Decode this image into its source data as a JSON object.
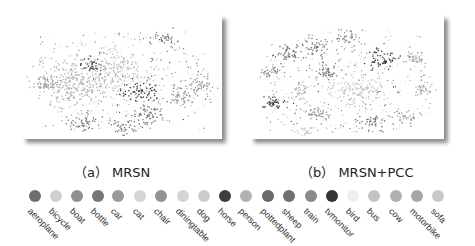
{
  "figure": {
    "panels": [
      {
        "id": "a",
        "caption": "（a） MRSN"
      },
      {
        "id": "b",
        "caption": "（b） MRSN+PCC"
      }
    ]
  },
  "legend": {
    "items": [
      {
        "label": "aeroplane",
        "color": "#6e6e6e"
      },
      {
        "label": "bicycle",
        "color": "#cfcfcf"
      },
      {
        "label": "boat",
        "color": "#8f8f8f"
      },
      {
        "label": "bottle",
        "color": "#777777"
      },
      {
        "label": "car",
        "color": "#9a9a9a"
      },
      {
        "label": "cat",
        "color": "#d6d6d6"
      },
      {
        "label": "chair",
        "color": "#929292"
      },
      {
        "label": "diningtable",
        "color": "#d4d4d4"
      },
      {
        "label": "dog",
        "color": "#cccccc"
      },
      {
        "label": "horse",
        "color": "#3e3e3e"
      },
      {
        "label": "person",
        "color": "#b2b2b2"
      },
      {
        "label": "pottedplant",
        "color": "#6a6a6a"
      },
      {
        "label": "sheep",
        "color": "#707070"
      },
      {
        "label": "train",
        "color": "#8a8a8a"
      },
      {
        "label": "tvmonitor",
        "color": "#333333"
      },
      {
        "label": "bird",
        "color": "#eeeeee"
      },
      {
        "label": "bus",
        "color": "#c4c4c4"
      },
      {
        "label": "cow",
        "color": "#b0b0b0"
      },
      {
        "label": "motorbike",
        "color": "#a6a6a6"
      },
      {
        "label": "sofa",
        "color": "#c8c8c8"
      }
    ]
  },
  "chart_data": [
    {
      "type": "scatter",
      "title": "（a） MRSN",
      "xlabel": "",
      "ylabel": "",
      "grid": false,
      "legend_position": "bottom",
      "categories": [
        "aeroplane",
        "bicycle",
        "boat",
        "bottle",
        "car",
        "cat",
        "chair",
        "diningtable",
        "dog",
        "horse",
        "person",
        "pottedplant",
        "sheep",
        "train",
        "tvmonitor",
        "bird",
        "bus",
        "cow",
        "motorbike",
        "sofa"
      ],
      "description": "2-D embedding of 20 classes; clusters heavily overlapping in a dense central mass with a few darker compact clusters",
      "clusters": [
        {
          "cx": 0.25,
          "cy": 0.55,
          "r": 0.18,
          "color": "#b2b2b2",
          "n": 260
        },
        {
          "cx": 0.45,
          "cy": 0.45,
          "r": 0.2,
          "color": "#bdbdbd",
          "n": 220
        },
        {
          "cx": 0.58,
          "cy": 0.62,
          "r": 0.1,
          "color": "#333333",
          "n": 60
        },
        {
          "cx": 0.35,
          "cy": 0.4,
          "r": 0.06,
          "color": "#3e3e3e",
          "n": 35
        },
        {
          "cx": 0.62,
          "cy": 0.8,
          "r": 0.09,
          "color": "#6e6e6e",
          "n": 60
        },
        {
          "cx": 0.8,
          "cy": 0.65,
          "r": 0.08,
          "color": "#8a8a8a",
          "n": 50
        },
        {
          "cx": 0.9,
          "cy": 0.55,
          "r": 0.07,
          "color": "#9a9a9a",
          "n": 45
        },
        {
          "cx": 0.3,
          "cy": 0.85,
          "r": 0.08,
          "color": "#777777",
          "n": 45
        },
        {
          "cx": 0.7,
          "cy": 0.2,
          "r": 0.06,
          "color": "#6a6a6a",
          "n": 30
        },
        {
          "cx": 0.12,
          "cy": 0.55,
          "r": 0.06,
          "color": "#929292",
          "n": 35
        },
        {
          "cx": 0.5,
          "cy": 0.9,
          "r": 0.07,
          "color": "#707070",
          "n": 35
        }
      ]
    },
    {
      "type": "scatter",
      "title": "（b） MRSN+PCC",
      "xlabel": "",
      "ylabel": "",
      "grid": false,
      "legend_position": "bottom",
      "categories": [
        "aeroplane",
        "bicycle",
        "boat",
        "bottle",
        "car",
        "cat",
        "chair",
        "diningtable",
        "dog",
        "horse",
        "person",
        "pottedplant",
        "sheep",
        "train",
        "tvmonitor",
        "bird",
        "bus",
        "cow",
        "motorbike",
        "sofa"
      ],
      "description": "2-D embedding of 20 classes; classes form more separated compact clusters arranged around a diffuse center",
      "clusters": [
        {
          "cx": 0.55,
          "cy": 0.6,
          "r": 0.14,
          "color": "#c4c4c4",
          "n": 150
        },
        {
          "cx": 0.2,
          "cy": 0.3,
          "r": 0.07,
          "color": "#6e6e6e",
          "n": 45
        },
        {
          "cx": 0.33,
          "cy": 0.25,
          "r": 0.07,
          "color": "#777777",
          "n": 45
        },
        {
          "cx": 0.5,
          "cy": 0.18,
          "r": 0.07,
          "color": "#8f8f8f",
          "n": 45
        },
        {
          "cx": 0.68,
          "cy": 0.35,
          "r": 0.07,
          "color": "#333333",
          "n": 55
        },
        {
          "cx": 0.85,
          "cy": 0.35,
          "r": 0.06,
          "color": "#a6a6a6",
          "n": 35
        },
        {
          "cx": 0.9,
          "cy": 0.6,
          "r": 0.06,
          "color": "#b0b0b0",
          "n": 35
        },
        {
          "cx": 0.1,
          "cy": 0.45,
          "r": 0.06,
          "color": "#929292",
          "n": 35
        },
        {
          "cx": 0.12,
          "cy": 0.7,
          "r": 0.06,
          "color": "#3e3e3e",
          "n": 40
        },
        {
          "cx": 0.25,
          "cy": 0.62,
          "r": 0.06,
          "color": "#b2b2b2",
          "n": 35
        },
        {
          "cx": 0.4,
          "cy": 0.45,
          "r": 0.06,
          "color": "#707070",
          "n": 40
        },
        {
          "cx": 0.35,
          "cy": 0.8,
          "r": 0.06,
          "color": "#8a8a8a",
          "n": 35
        },
        {
          "cx": 0.62,
          "cy": 0.85,
          "r": 0.06,
          "color": "#6a6a6a",
          "n": 35
        },
        {
          "cx": 0.8,
          "cy": 0.82,
          "r": 0.05,
          "color": "#9a9a9a",
          "n": 30
        },
        {
          "cx": 0.28,
          "cy": 0.92,
          "r": 0.05,
          "color": "#c8c8c8",
          "n": 25
        }
      ]
    }
  ]
}
